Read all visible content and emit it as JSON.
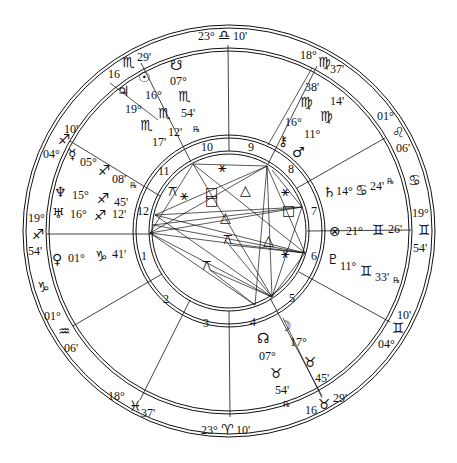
{
  "chart": {
    "type": "astrological-natal-chart",
    "center": [
      229,
      231
    ],
    "rings": {
      "outer": 206,
      "outer_inner": 203,
      "zodiac_inner": 183,
      "zodiac_inner2": 180,
      "house_outer": 96,
      "house_outer2": 93,
      "house_inner": 80,
      "house_inner2": 77
    },
    "colors": {
      "ink": "#111111",
      "background": "#ffffff"
    }
  },
  "cusps": [
    {
      "id": "mc",
      "label_deg": "23°",
      "sign": "♎",
      "sign_name": "libra",
      "label_min": "10'",
      "x": 200,
      "y": 39
    },
    {
      "id": "ic",
      "label_deg": "23°",
      "sign": "♈",
      "sign_name": "aries",
      "label_min": "10'",
      "x": 200,
      "y": 422
    },
    {
      "id": "asc",
      "label_deg": "19°",
      "sign": "♐",
      "sign_name": "sagittarius",
      "label_min": "54'"
    },
    {
      "id": "dsc",
      "label_deg": "19°",
      "sign": "♊",
      "sign_name": "gemini",
      "label_min": "54'"
    },
    {
      "id": "c11",
      "label_deg": "16",
      "sign": "♏",
      "sign_name": "scorpio",
      "label_min": "29'"
    },
    {
      "id": "c9",
      "label_deg": "18°",
      "sign": "♍",
      "sign_name": "virgo",
      "label_min": "37'"
    },
    {
      "id": "c8",
      "label_deg": "01°",
      "sign": "♌",
      "sign_name": "leo",
      "label_min": "06'"
    },
    {
      "id": "c12",
      "label_deg": "04°",
      "sign": "♐",
      "sign_name": "sagittarius",
      "label_min": "10'"
    },
    {
      "id": "c2",
      "label_deg": "01°",
      "sign": "♒",
      "sign_name": "aquarius",
      "label_min": "06'"
    },
    {
      "id": "c3",
      "label_deg": "18°",
      "sign": "♓",
      "sign_name": "pisces",
      "label_min": "37'"
    },
    {
      "id": "c5",
      "label_deg": "16",
      "sign": "♉",
      "sign_name": "taurus",
      "label_min": "29'"
    },
    {
      "id": "c6",
      "label_deg": "04°",
      "sign": "♊",
      "sign_name": "gemini",
      "label_min": "10'"
    }
  ],
  "intercepted": [
    {
      "sign": "♑",
      "sign_name": "capricorn"
    },
    {
      "sign": "♋",
      "sign_name": "cancer"
    }
  ],
  "houses": [
    "1",
    "2",
    "3",
    "4",
    "5",
    "6",
    "7",
    "8",
    "9",
    "10",
    "11",
    "12"
  ],
  "planets": [
    {
      "name": "south-node",
      "glyph": "☋",
      "deg": "07°",
      "sign": "♏",
      "min": "54'",
      "retro": "℞"
    },
    {
      "name": "sun",
      "glyph": "☉",
      "deg": "16°",
      "sign": "♏",
      "min": "12'",
      "retro": ""
    },
    {
      "name": "jupiter",
      "glyph": "♃",
      "deg": "19°",
      "sign": "♏",
      "min": "17'",
      "retro": ""
    },
    {
      "name": "chiron",
      "glyph": "⚷",
      "deg": "16°",
      "sign": "♍",
      "min": "38'",
      "retro": ""
    },
    {
      "name": "mars",
      "glyph": "♂",
      "deg": "11°",
      "sign": "♍",
      "min": "14'",
      "retro": ""
    },
    {
      "name": "saturn",
      "glyph": "♄",
      "deg": "14°",
      "sign": "♋",
      "min": "24'",
      "retro": "℞"
    },
    {
      "name": "part-of-fortune",
      "glyph": "⊗",
      "deg": "21°",
      "sign": "♊",
      "min": "26'",
      "retro": ""
    },
    {
      "name": "pluto",
      "glyph": "♇",
      "deg": "11°",
      "sign": "♊",
      "min": "33'",
      "retro": "℞"
    },
    {
      "name": "moon",
      "glyph": "☽",
      "deg": "17°",
      "sign": "♉",
      "min": "45'",
      "retro": ""
    },
    {
      "name": "north-node",
      "glyph": "☊",
      "deg": "07°",
      "sign": "♉",
      "min": "54'",
      "retro": "℞"
    },
    {
      "name": "venus",
      "glyph": "♀",
      "deg": "01°",
      "sign": "♑",
      "min": "41'",
      "retro": ""
    },
    {
      "name": "uranus",
      "glyph": "♅",
      "deg": "16°",
      "sign": "♐",
      "min": "12'",
      "retro": ""
    },
    {
      "name": "neptune",
      "glyph": "♆",
      "deg": "15°",
      "sign": "♐",
      "min": "45'",
      "retro": ""
    },
    {
      "name": "mercury",
      "glyph": "☿",
      "deg": "05°",
      "sign": "♐",
      "min": "08'",
      "retro": "℞"
    }
  ],
  "aspect_glyphs": [
    {
      "name": "sextile",
      "glyph": "⚹"
    },
    {
      "name": "square",
      "glyph": "□"
    },
    {
      "name": "trine",
      "glyph": "△"
    },
    {
      "name": "quincunx",
      "glyph": "⚻"
    },
    {
      "name": "semisextile",
      "glyph": "⚺"
    }
  ]
}
